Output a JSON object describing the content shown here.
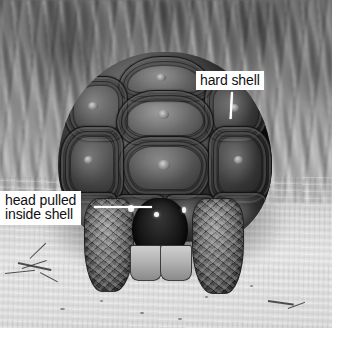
{
  "figure": {
    "type": "annotated-photograph",
    "color_mode": "black-and-white",
    "width": 341,
    "height": 338
  },
  "photo": {
    "alt": "Black and white photograph of a tortoise on sandy ground in front of dry grass, with its head pulled inside its shell",
    "background_scene": "dry grass and sandy ground",
    "left": 0,
    "top": 0,
    "width": 332,
    "height": 328
  },
  "annotations": [
    {
      "id": "hard-shell",
      "text": "hard shell",
      "lines": [
        "hard shell"
      ],
      "box": {
        "left": 196,
        "top": 71,
        "width": 78,
        "height": 21
      },
      "leader": {
        "orientation": "vertical",
        "from_x": 233,
        "from_y": 92,
        "to_x": 231,
        "to_y": 118
      },
      "text_color": "#101010",
      "box_color": "#ffffff",
      "leader_color": "#ffffff"
    },
    {
      "id": "head-pulled-inside-shell",
      "text": "head pulled inside shell",
      "lines": [
        "head pulled",
        "inside shell"
      ],
      "box": {
        "left": 0,
        "top": 191,
        "width": 96,
        "height": 35
      },
      "leader": {
        "orientation": "horizontal",
        "from_x": 96,
        "from_y": 207,
        "to_x": 152,
        "to_y": 207
      },
      "text_color": "#101010",
      "box_color": "#ffffff",
      "leader_color": "#ffffff"
    }
  ],
  "palette": {
    "page_background": "#ffffff",
    "label_background": "#ffffff",
    "label_text": "#101010",
    "leader_line": "#ffffff",
    "photo_shadow": "#1e1d1b",
    "photo_highlight": "#e2e0d8"
  }
}
